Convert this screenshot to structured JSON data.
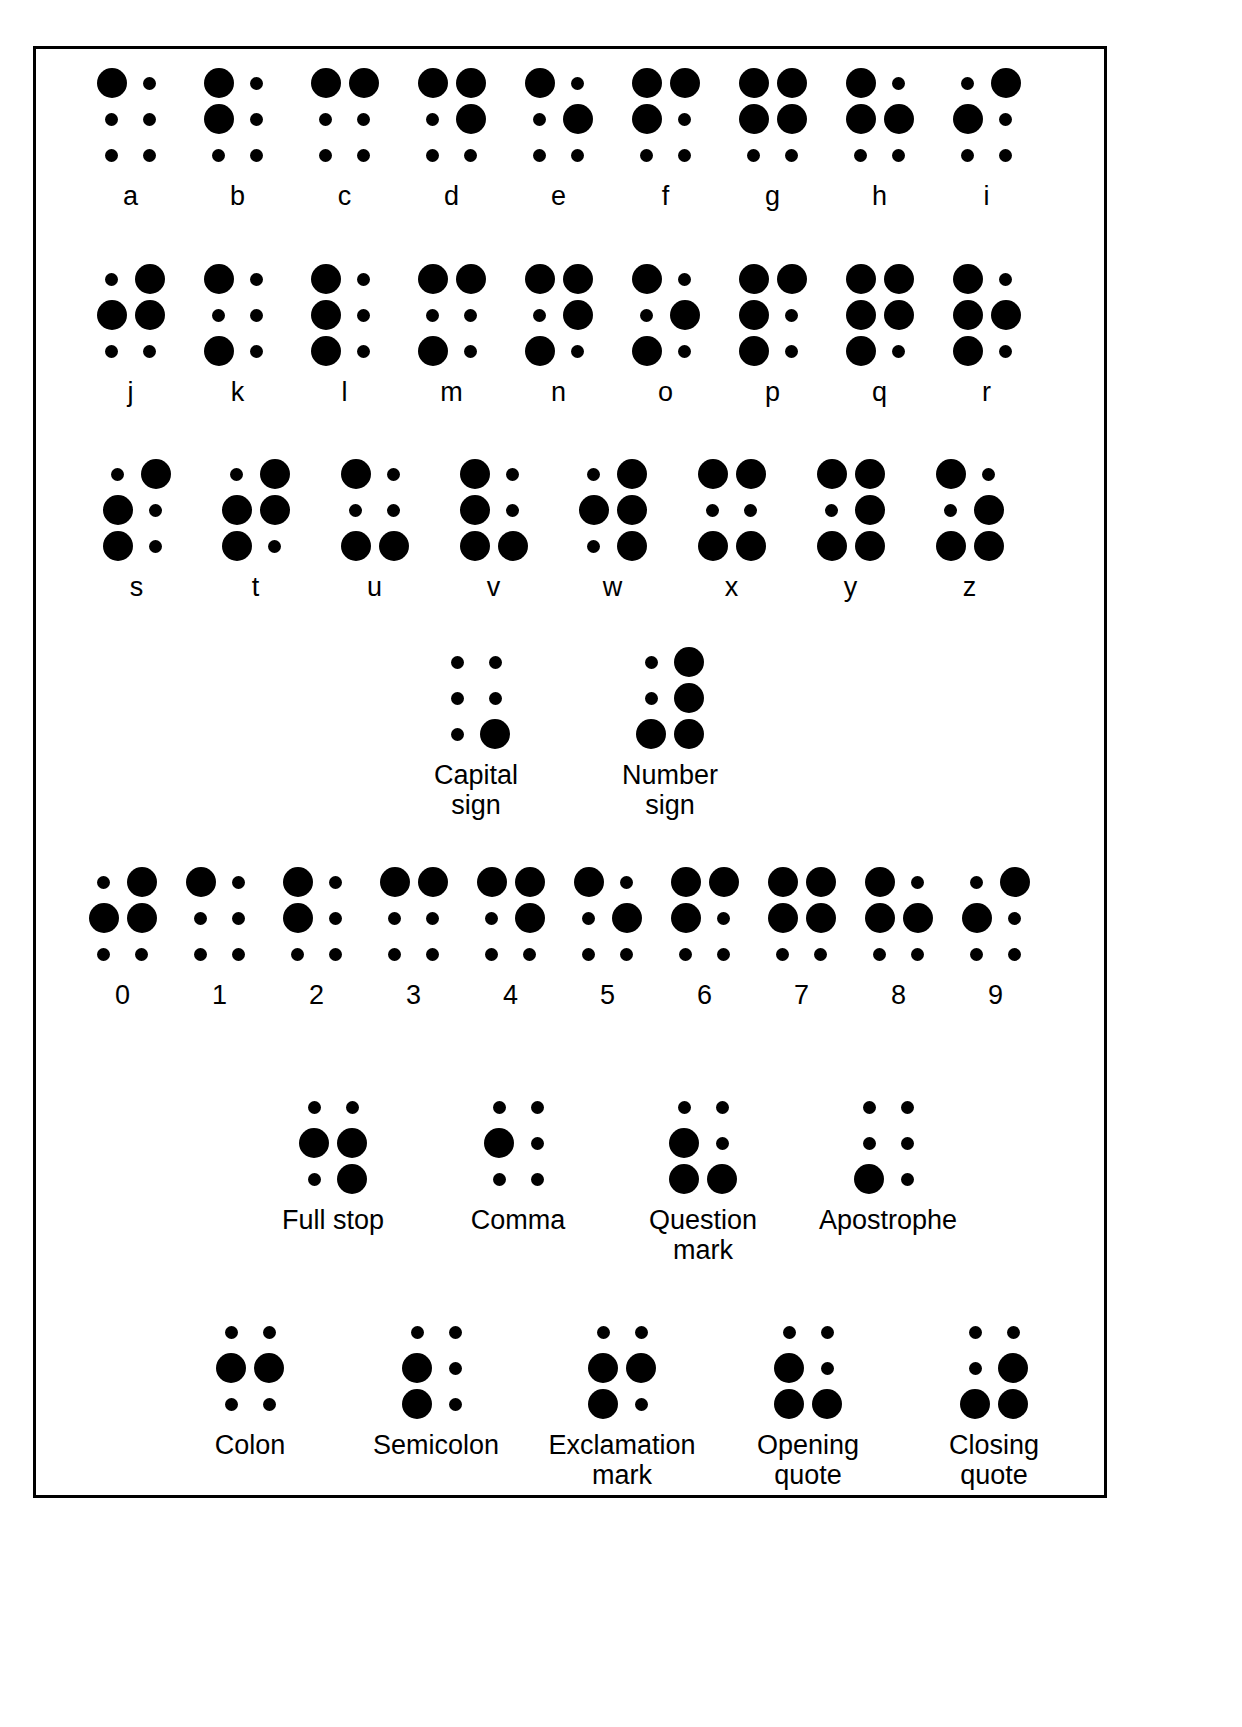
{
  "page": {
    "background_color": "#ffffff",
    "dot_color": "#000000",
    "border_color": "#000000"
  },
  "legend": {
    "raised_dot": "large filled circle",
    "empty_position": "small filled circle",
    "cell_layout": "2 columns x 3 rows; dots numbered 1-2-3 down left column, 4-5-6 down right column"
  },
  "sections": [
    {
      "id": "letters-1",
      "name": "letters-row-1",
      "cells": [
        {
          "label": "a",
          "dots": [
            1
          ]
        },
        {
          "label": "b",
          "dots": [
            1,
            2
          ]
        },
        {
          "label": "c",
          "dots": [
            1,
            4
          ]
        },
        {
          "label": "d",
          "dots": [
            1,
            4,
            5
          ]
        },
        {
          "label": "e",
          "dots": [
            1,
            5
          ]
        },
        {
          "label": "f",
          "dots": [
            1,
            2,
            4
          ]
        },
        {
          "label": "g",
          "dots": [
            1,
            2,
            4,
            5
          ]
        },
        {
          "label": "h",
          "dots": [
            1,
            2,
            5
          ]
        },
        {
          "label": "i",
          "dots": [
            2,
            4
          ]
        }
      ]
    },
    {
      "id": "letters-2",
      "name": "letters-row-2",
      "cells": [
        {
          "label": "j",
          "dots": [
            2,
            4,
            5
          ]
        },
        {
          "label": "k",
          "dots": [
            1,
            3
          ]
        },
        {
          "label": "l",
          "dots": [
            1,
            2,
            3
          ]
        },
        {
          "label": "m",
          "dots": [
            1,
            3,
            4
          ]
        },
        {
          "label": "n",
          "dots": [
            1,
            3,
            4,
            5
          ]
        },
        {
          "label": "o",
          "dots": [
            1,
            3,
            5
          ]
        },
        {
          "label": "p",
          "dots": [
            1,
            2,
            3,
            4
          ]
        },
        {
          "label": "q",
          "dots": [
            1,
            2,
            3,
            4,
            5
          ]
        },
        {
          "label": "r",
          "dots": [
            1,
            2,
            3,
            5
          ]
        }
      ]
    },
    {
      "id": "letters-3",
      "name": "letters-row-3",
      "cells": [
        {
          "label": "s",
          "dots": [
            2,
            3,
            4
          ]
        },
        {
          "label": "t",
          "dots": [
            2,
            3,
            4,
            5
          ]
        },
        {
          "label": "u",
          "dots": [
            1,
            3,
            6
          ]
        },
        {
          "label": "v",
          "dots": [
            1,
            2,
            3,
            6
          ]
        },
        {
          "label": "w",
          "dots": [
            2,
            4,
            5,
            6
          ]
        },
        {
          "label": "x",
          "dots": [
            1,
            3,
            4,
            6
          ]
        },
        {
          "label": "y",
          "dots": [
            1,
            3,
            4,
            5,
            6
          ]
        },
        {
          "label": "z",
          "dots": [
            1,
            3,
            5,
            6
          ]
        }
      ]
    },
    {
      "id": "signs",
      "name": "indicator-signs",
      "cells": [
        {
          "label": "Capital sign",
          "dots": [
            6
          ]
        },
        {
          "label": "Number\nsign",
          "dots": [
            3,
            4,
            5,
            6
          ]
        }
      ]
    },
    {
      "id": "digits",
      "name": "digits-row",
      "cells": [
        {
          "label": "0",
          "dots": [
            2,
            4,
            5
          ]
        },
        {
          "label": "1",
          "dots": [
            1
          ]
        },
        {
          "label": "2",
          "dots": [
            1,
            2
          ]
        },
        {
          "label": "3",
          "dots": [
            1,
            4
          ]
        },
        {
          "label": "4",
          "dots": [
            1,
            4,
            5
          ]
        },
        {
          "label": "5",
          "dots": [
            1,
            5
          ]
        },
        {
          "label": "6",
          "dots": [
            1,
            2,
            4
          ]
        },
        {
          "label": "7",
          "dots": [
            1,
            2,
            4,
            5
          ]
        },
        {
          "label": "8",
          "dots": [
            1,
            2,
            5
          ]
        },
        {
          "label": "9",
          "dots": [
            2,
            4
          ]
        }
      ]
    },
    {
      "id": "punct-1",
      "name": "punctuation-row-1",
      "cells": [
        {
          "label": "Full stop",
          "dots": [
            2,
            5,
            6
          ]
        },
        {
          "label": "Comma",
          "dots": [
            2
          ]
        },
        {
          "label": "Question\nmark",
          "dots": [
            2,
            3,
            6
          ]
        },
        {
          "label": "Apostrophe",
          "dots": [
            3
          ]
        }
      ]
    },
    {
      "id": "punct-2",
      "name": "punctuation-row-2",
      "cells": [
        {
          "label": "Colon",
          "dots": [
            2,
            5
          ]
        },
        {
          "label": "Semicolon",
          "dots": [
            2,
            3
          ]
        },
        {
          "label": "Exclamation\nmark",
          "dots": [
            2,
            3,
            5
          ]
        },
        {
          "label": "Opening\nquote",
          "dots": [
            2,
            3,
            6
          ]
        },
        {
          "label": "Closing\nquote",
          "dots": [
            3,
            5,
            6
          ]
        }
      ]
    }
  ]
}
